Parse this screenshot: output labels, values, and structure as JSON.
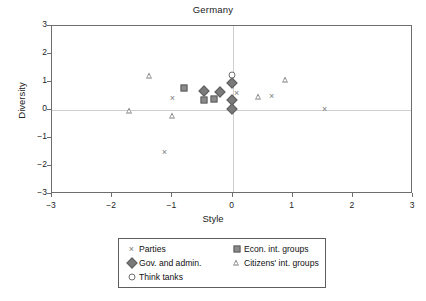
{
  "chart_data": {
    "type": "scatter",
    "title": "Germany",
    "xlabel": "Style",
    "ylabel": "Diversity",
    "xlim": [
      -3,
      3
    ],
    "ylim": [
      -3,
      3
    ],
    "xticks": [
      "-3",
      "-2",
      "-1",
      "0",
      "1",
      "2",
      "3"
    ],
    "xtick_values": [
      -3,
      -2,
      -1,
      0,
      1,
      2,
      3
    ],
    "yticks": [
      "3",
      "2",
      "1",
      "0",
      "-1",
      "-2",
      "-3"
    ],
    "ytick_values": [
      3,
      2,
      1,
      0,
      -1,
      -2,
      -3
    ],
    "grid": false,
    "zero_reference_lines": true,
    "legend_position": "below-center",
    "marker_color": "#7d7d7d",
    "series": [
      {
        "name": "Parties",
        "marker": "x",
        "points": [
          {
            "x": -1.13,
            "y": -1.5
          },
          {
            "x": -1.0,
            "y": 0.42
          },
          {
            "x": -0.45,
            "y": 0.65
          },
          {
            "x": 0.07,
            "y": 0.6
          },
          {
            "x": 0.65,
            "y": 0.5
          },
          {
            "x": 1.53,
            "y": 0.05
          }
        ]
      },
      {
        "name": "Gov. and admin.",
        "marker": "diamond",
        "points": [
          {
            "x": -0.47,
            "y": 0.68
          },
          {
            "x": -0.21,
            "y": 0.66
          },
          {
            "x": -0.01,
            "y": 0.98
          },
          {
            "x": -0.01,
            "y": 0.35
          },
          {
            "x": -0.01,
            "y": 0.05
          }
        ]
      },
      {
        "name": "Think tanks",
        "marker": "circle",
        "points": [
          {
            "x": -0.01,
            "y": 1.26
          }
        ]
      },
      {
        "name": "Econ. int. groups",
        "marker": "square",
        "points": [
          {
            "x": -0.8,
            "y": 0.8
          },
          {
            "x": -0.48,
            "y": 0.36
          },
          {
            "x": -0.31,
            "y": 0.38
          }
        ]
      },
      {
        "name": "Citizens' int. groups",
        "marker": "triangle",
        "points": [
          {
            "x": -1.72,
            "y": -0.02
          },
          {
            "x": -1.38,
            "y": 1.22
          },
          {
            "x": -1.0,
            "y": -0.2
          },
          {
            "x": 0.43,
            "y": 0.48
          },
          {
            "x": 0.88,
            "y": 1.07
          }
        ]
      }
    ]
  },
  "legend": {
    "entries": [
      {
        "label": "Parties",
        "marker": "x"
      },
      {
        "label": "Econ. int. groups",
        "marker": "square"
      },
      {
        "label": "Gov. and admin.",
        "marker": "diamond"
      },
      {
        "label": "Citizens' int. groups",
        "marker": "triangle"
      },
      {
        "label": "Think tanks",
        "marker": "circle"
      }
    ]
  }
}
